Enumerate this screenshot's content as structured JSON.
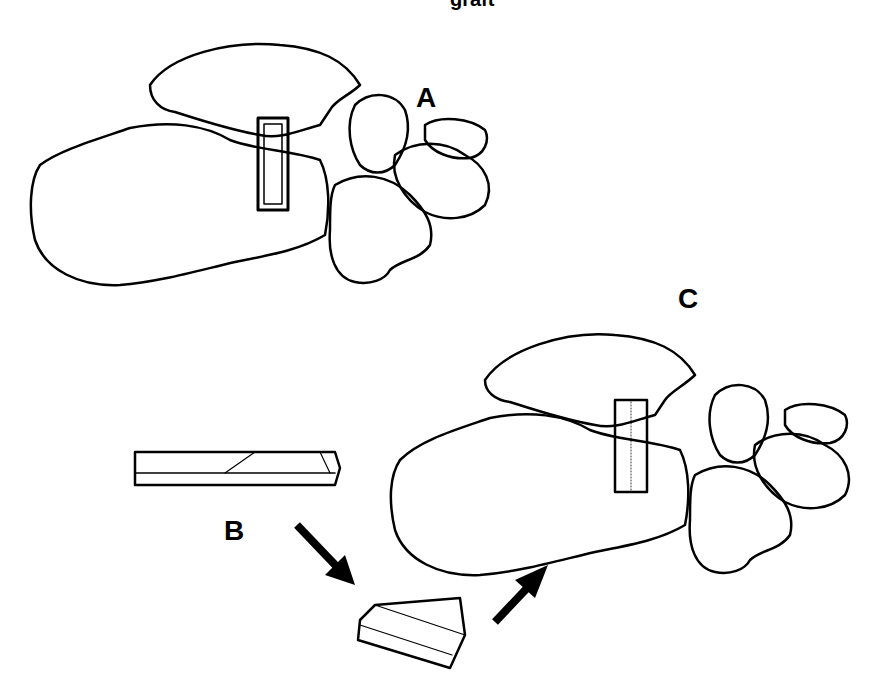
{
  "figure": {
    "top_caption_fragment": "graft",
    "labels": {
      "a": "A",
      "b": "B",
      "c": "C"
    },
    "panels": [
      {
        "id": "A",
        "description": "Foot bones (lateral view) with rectangular slot cut into calcaneus"
      },
      {
        "id": "B",
        "description": "Bone graft block shown as long strip and as trimmed wedge with arrows indicating insertion"
      },
      {
        "id": "C",
        "description": "Foot bones with graft block inserted in slot"
      }
    ],
    "colors": {
      "ink": "#000000",
      "background": "#ffffff"
    }
  }
}
